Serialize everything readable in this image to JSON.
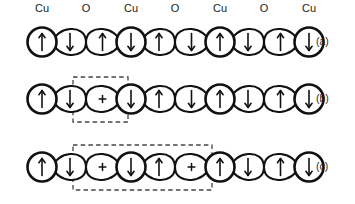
{
  "figure": {
    "caption_labels": [
      "(a)",
      "(b)",
      "(c)"
    ],
    "site_labels": [
      "Cu",
      "O",
      "Cu",
      "O",
      "Cu",
      "O",
      "Cu"
    ],
    "spin_up_glyph": "↑",
    "spin_down_glyph": "↓",
    "hole_glyph": "+",
    "stroke_color": "#111111",
    "background_color": "#ffffff",
    "dashed_box_color": "#444444"
  },
  "chart_data": {
    "type": "diagram",
    "subtitle": "",
    "xlabel": "",
    "ylabel": "",
    "site_sequence": [
      "Cu",
      "O",
      "Cu",
      "O",
      "Cu",
      "O",
      "Cu"
    ],
    "site_centers_x": [
      42,
      86,
      131,
      175,
      220,
      264,
      309
    ],
    "row_centers_y": [
      42,
      99,
      167
    ],
    "rows": [
      {
        "label": "(a)",
        "cu_spins": [
          "up",
          "down",
          "up",
          "down"
        ],
        "oxygen_lobes": [
          [
            "down",
            "up"
          ],
          [
            "up",
            "down"
          ],
          [
            "down",
            "up"
          ]
        ],
        "dashed_box": null
      },
      {
        "label": "(b)",
        "cu_spins": [
          "up",
          "down",
          "up",
          "down"
        ],
        "oxygen_lobes": [
          [
            "down",
            "hole"
          ],
          [
            "up",
            "down"
          ],
          [
            "down",
            "up"
          ]
        ],
        "dashed_box": {
          "x": 73,
          "y": 77,
          "width": 55,
          "height": 45
        }
      },
      {
        "label": "(c)",
        "cu_spins": [
          "up",
          "down",
          "up",
          "down"
        ],
        "oxygen_lobes": [
          [
            "down",
            "hole"
          ],
          [
            "up",
            "hole"
          ],
          [
            "down",
            "up"
          ]
        ],
        "dashed_box": {
          "x": 73,
          "y": 145,
          "width": 139,
          "height": 45
        }
      }
    ]
  }
}
